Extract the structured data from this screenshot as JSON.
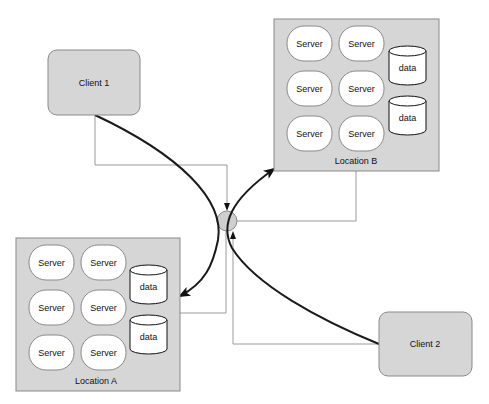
{
  "diagram": {
    "clients": [
      {
        "id": "client1",
        "label": "Client 1",
        "x": 48,
        "y": 50,
        "w": 92,
        "h": 65
      },
      {
        "id": "client2",
        "label": "Client 2",
        "x": 379,
        "y": 312,
        "w": 93,
        "h": 64
      }
    ],
    "locations": [
      {
        "id": "locationB",
        "label": "Location B",
        "x": 274,
        "y": 19,
        "w": 165,
        "h": 152,
        "servers": [
          "Server",
          "Server",
          "Server",
          "Server",
          "Server",
          "Server"
        ],
        "databases": [
          "data",
          "data"
        ]
      },
      {
        "id": "locationA",
        "label": "Location A",
        "x": 16,
        "y": 238,
        "w": 164,
        "h": 153,
        "servers": [
          "Server",
          "Server",
          "Server",
          "Server",
          "Server",
          "Server"
        ],
        "databases": [
          "data",
          "data"
        ]
      }
    ],
    "hub": {
      "cx": 227,
      "cy": 221,
      "r": 10
    },
    "colors": {
      "box_fill": "#d6d6d6",
      "box_stroke": "#8a8a8a",
      "server_fill": "#ffffff",
      "thin_line": "#9a9a9a",
      "thick_line": "#1a1a1a",
      "hub_fill": "#cfcfcf"
    }
  }
}
